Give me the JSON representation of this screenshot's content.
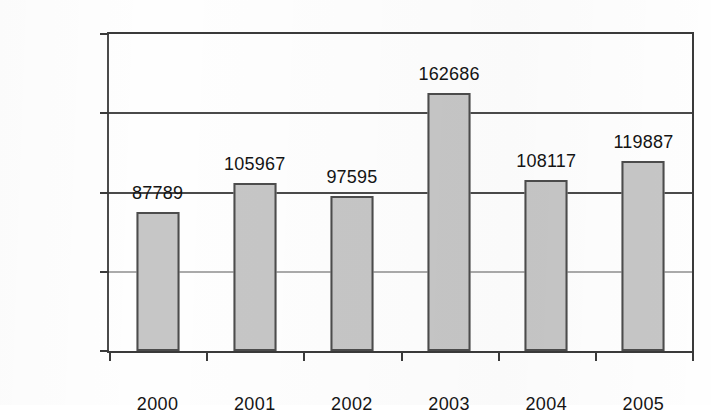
{
  "chart_data": {
    "type": "bar",
    "title": "",
    "subtitle": "",
    "xlabel": "",
    "ylabel": "",
    "categories": [
      "2000",
      "2001",
      "2002",
      "2003",
      "2004",
      "2005"
    ],
    "values": [
      87789,
      105967,
      97595,
      162686,
      108117,
      119887
    ],
    "data_labels": [
      "87789",
      "105967",
      "97595",
      "162686",
      "108117",
      "119887"
    ],
    "ylim": [
      0,
      200000
    ],
    "ytick_values": [
      0,
      50000,
      100000,
      150000,
      200000
    ],
    "ytick_labels": [
      "0",
      "50 000",
      "100 000",
      "150 000",
      "200 000"
    ],
    "grid": true,
    "grid_axis": "y",
    "legend": null,
    "legend_position": "none",
    "series": [
      {
        "name": "",
        "values": [
          87789,
          105967,
          97595,
          162686,
          108117,
          119887
        ]
      }
    ],
    "colors": {
      "bar_fill": "#c6c6c6",
      "bar_border": "#4c4c4c",
      "axis": "#3a3a3a",
      "gridline": "#4a4a4a",
      "text": "#151515",
      "background": "#fefefe"
    }
  }
}
